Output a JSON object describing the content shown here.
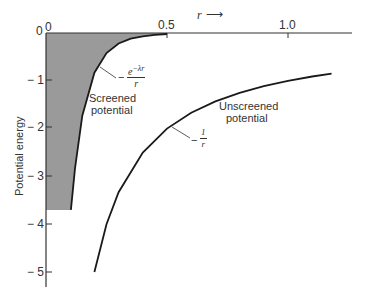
{
  "chart_data": {
    "type": "line",
    "title": "",
    "xlabel": "r",
    "ylabel": "Potential energy",
    "xlim": [
      0,
      1.2
    ],
    "ylim": [
      -5.3,
      0
    ],
    "x_ticks": [
      "0",
      "0.5",
      "1.0"
    ],
    "y_ticks": [
      "0",
      "-1",
      "-2",
      "-3",
      "-4",
      "-5"
    ],
    "grid": false,
    "legend": "none",
    "series": [
      {
        "name": "Screened potential",
        "formula": "-e^{-λr}/r",
        "filled": true,
        "fill_color": "#9a9a9a",
        "x": [
          0.103,
          0.12,
          0.15,
          0.2,
          0.25,
          0.3,
          0.35,
          0.4,
          0.45,
          0.5
        ],
        "y": [
          -3.7,
          -2.83,
          -1.73,
          -0.83,
          -0.42,
          -0.22,
          -0.12,
          -0.07,
          -0.04,
          -0.02
        ]
      },
      {
        "name": "Unscreened potential",
        "formula": "-1/r",
        "filled": false,
        "x": [
          0.2,
          0.25,
          0.3,
          0.4,
          0.5,
          0.6,
          0.7,
          0.8,
          0.9,
          1.0,
          1.1,
          1.18
        ],
        "y": [
          -5.0,
          -4.0,
          -3.33,
          -2.5,
          -2.0,
          -1.67,
          -1.43,
          -1.25,
          -1.11,
          -1.0,
          -0.91,
          -0.85
        ]
      }
    ],
    "annotations": [
      {
        "text": "Screened potential",
        "target": "screened curve"
      },
      {
        "text": "-e^{-λr}/r",
        "target": "screened curve"
      },
      {
        "text": "Unscreened potential",
        "target": "unscreened curve"
      },
      {
        "text": "-1/r",
        "target": "unscreened curve"
      }
    ]
  },
  "labels": {
    "origin": "0",
    "origin_y": "0",
    "x_tick_05": "0.5",
    "x_tick_10": "1.0",
    "x_axis_label": "r",
    "x_axis_arrow": "⟶",
    "y_axis_label": "Potential energy",
    "y_ticks": [
      "− 1",
      "− 2",
      "− 3",
      "− 4",
      "− 5"
    ],
    "screened_1": "Screened",
    "screened_2": "potential",
    "unscreened_1": "Unscreened",
    "unscreened_2": "potential",
    "screened_formula_num": "e",
    "screened_formula_exp": "−λr",
    "screened_formula_den": "r",
    "screened_minus": "−",
    "unscreened_minus": "−",
    "unscreened_formula_num": "1",
    "unscreened_formula_den": "r"
  }
}
